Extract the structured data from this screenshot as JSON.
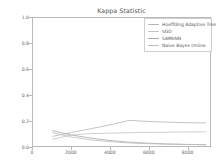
{
  "chart_data": {
    "type": "line",
    "title": "Kappa Statistic",
    "xlabel": "",
    "ylabel": "",
    "xlim": [
      0,
      9200
    ],
    "ylim": [
      0.0,
      1.0
    ],
    "grid": false,
    "legend_position": "upper right",
    "xticks": [
      0,
      2000,
      4000,
      6000,
      8000
    ],
    "xtick_labels": [
      "0",
      "2000",
      "4000",
      "6000",
      "8000"
    ],
    "yticks": [
      0.0,
      0.2,
      0.4,
      0.6,
      0.8,
      1.0
    ],
    "ytick_labels": [
      "0.0",
      "0.2",
      "0.4",
      "0.6",
      "0.8",
      "1.0"
    ],
    "x": [
      1000,
      2000,
      3000,
      4000,
      5000,
      6000,
      7000,
      8000,
      9000
    ],
    "series": [
      {
        "name": "Hoeffding Adaptive Tree",
        "color": "#b5b5b5",
        "values": [
          0.075,
          0.105,
          0.135,
          0.165,
          0.2,
          0.192,
          0.186,
          0.182,
          0.18
        ]
      },
      {
        "name": "SGD",
        "color": "#c4c4c4",
        "values": [
          0.052,
          0.086,
          0.097,
          0.1,
          0.104,
          0.106,
          0.108,
          0.11,
          0.111
        ]
      },
      {
        "name": "SAMkNN",
        "color": "#a8a8a8",
        "values": [
          0.12,
          0.086,
          0.062,
          0.043,
          0.03,
          0.022,
          0.016,
          0.012,
          0.01
        ]
      },
      {
        "name": "Naive Bayes Online",
        "color": "#bdbdbd",
        "values": [
          0.105,
          0.07,
          0.048,
          0.034,
          0.024,
          0.018,
          0.014,
          0.012,
          0.011
        ]
      }
    ]
  }
}
